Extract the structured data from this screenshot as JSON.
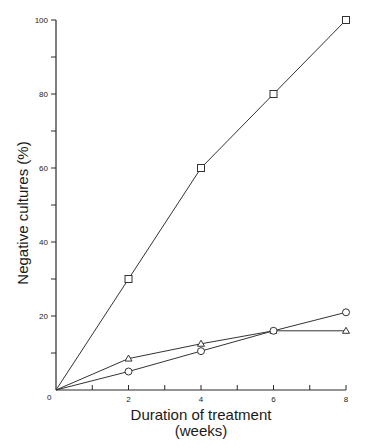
{
  "chart_data": {
    "type": "line",
    "title": "",
    "xlabel": "Duration of treatment",
    "xlabel_sub": "(weeks)",
    "ylabel": "Negative cultures (%)",
    "xlim": [
      0,
      8
    ],
    "ylim": [
      0,
      100
    ],
    "x_major_ticks": [
      0,
      2,
      4,
      6,
      8
    ],
    "x_minor_ticks": [
      1,
      3,
      5,
      7
    ],
    "y_major_ticks": [
      0,
      20,
      40,
      60,
      80,
      100
    ],
    "y_minor_ticks": [
      10,
      30,
      50,
      70,
      90
    ],
    "x_tick_labels": [
      "0",
      "2",
      "4",
      "6",
      "8"
    ],
    "y_tick_labels": [
      "20",
      "40",
      "60",
      "80",
      "100"
    ],
    "grid": false,
    "legend": null,
    "x": [
      0,
      2,
      4,
      6,
      8
    ],
    "series": [
      {
        "name": "square",
        "marker": "square",
        "values": [
          0,
          30,
          60,
          80,
          100
        ]
      },
      {
        "name": "triangle",
        "marker": "triangle",
        "values": [
          0,
          8.5,
          12.5,
          16,
          16
        ]
      },
      {
        "name": "circle",
        "marker": "circle",
        "values": [
          0,
          5,
          10.5,
          16,
          21
        ]
      }
    ],
    "colors": {
      "line": "#333333",
      "marker_fill": "#ffffff",
      "axis": "#2a2a2a"
    }
  }
}
